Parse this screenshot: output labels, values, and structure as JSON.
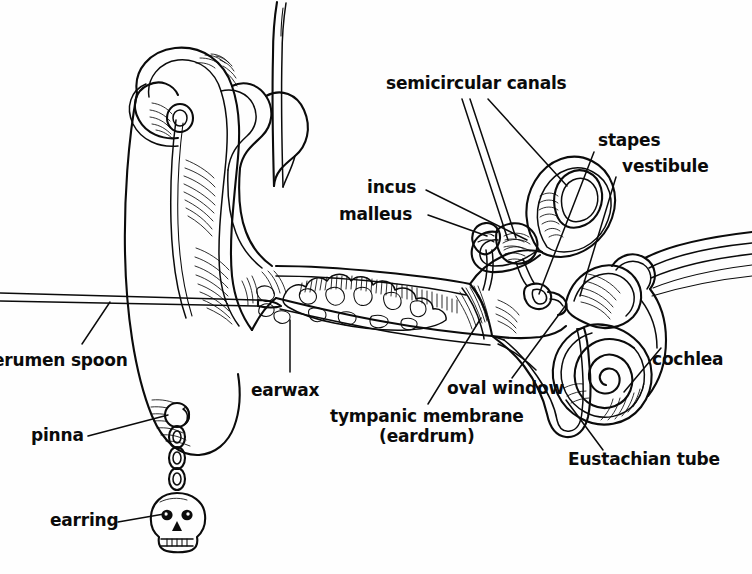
{
  "document": {
    "kind": "anatomical-illustration",
    "subject": "Human ear cross-section with cerumen spoon",
    "style": "black ink line drawing on white page",
    "width": 752,
    "height": 574,
    "background_color": "#fefefe",
    "ink_color": "#0b0b0b"
  },
  "labels": {
    "semicircular_canals": "semicircular canals",
    "stapes": "stapes",
    "vestibule": "vestibule",
    "incus": "incus",
    "malleus": "malleus",
    "cochlea": "cochlea",
    "oval_window": "oval window",
    "tympanic_membrane_line1": "tympanic membrane",
    "tympanic_membrane_line2": "(eardrum)",
    "eustachian_tube": "Eustachian tube",
    "earwax": "earwax",
    "cerumen_spoon": "erumen spoon",
    "pinna": "pinna",
    "earring": "earring"
  },
  "structures": [
    {
      "name": "pinna",
      "region": "outer ear",
      "note": "auricle with helix, antihelix, tragus and lobe"
    },
    {
      "name": "earring",
      "region": "outer ear",
      "note": "skull pendant on chain through the lobe"
    },
    {
      "name": "cerumen spoon",
      "region": "instrument",
      "note": "thin curette entering from the left edge"
    },
    {
      "name": "earwax",
      "region": "ear canal",
      "note": "cloud-like cerumen mass filling the external auditory canal"
    },
    {
      "name": "tympanic membrane (eardrum)",
      "region": "middle ear boundary"
    },
    {
      "name": "malleus",
      "region": "middle ear ossicle"
    },
    {
      "name": "incus",
      "region": "middle ear ossicle"
    },
    {
      "name": "stapes",
      "region": "middle ear ossicle"
    },
    {
      "name": "oval window",
      "region": "middle/inner ear boundary"
    },
    {
      "name": "semicircular canals",
      "region": "inner ear",
      "count": 3
    },
    {
      "name": "vestibule",
      "region": "inner ear"
    },
    {
      "name": "cochlea",
      "region": "inner ear",
      "note": "spiral with cochlear nerve fibers to the right"
    },
    {
      "name": "Eustachian tube",
      "region": "middle ear",
      "note": "descending tube toward the nasopharynx"
    }
  ]
}
